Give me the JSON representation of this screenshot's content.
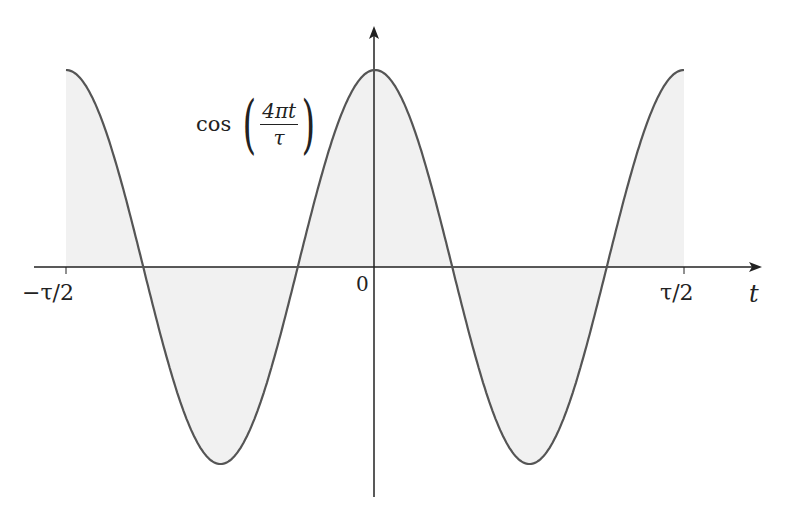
{
  "chart_data": {
    "type": "area",
    "title": "",
    "function_label": {
      "name": "cos",
      "numerator": "4πt",
      "denominator": "τ"
    },
    "xlabel": "t",
    "ylabel": "",
    "x_range": [
      -0.5,
      0.5
    ],
    "x_unit": "τ",
    "y_range": [
      -1,
      1
    ],
    "tick_labels": {
      "left": "−τ/2",
      "origin": "0",
      "right": "τ/2"
    },
    "series": [
      {
        "name": "cos(4πt/τ)",
        "frequency_cycles": 2,
        "amplitude": 1,
        "fill": "#f1f1f1",
        "stroke": "#555555"
      }
    ],
    "grid": false,
    "legend": "none",
    "sample_points": {
      "x": [
        -0.5,
        -0.375,
        -0.25,
        -0.125,
        0,
        0.125,
        0.25,
        0.375,
        0.5
      ],
      "y": [
        1,
        0,
        -1,
        0,
        1,
        0,
        -1,
        0,
        1
      ]
    }
  },
  "colors": {
    "curve": "#555555",
    "fill": "#f1f1f1",
    "axis": "#222222"
  }
}
